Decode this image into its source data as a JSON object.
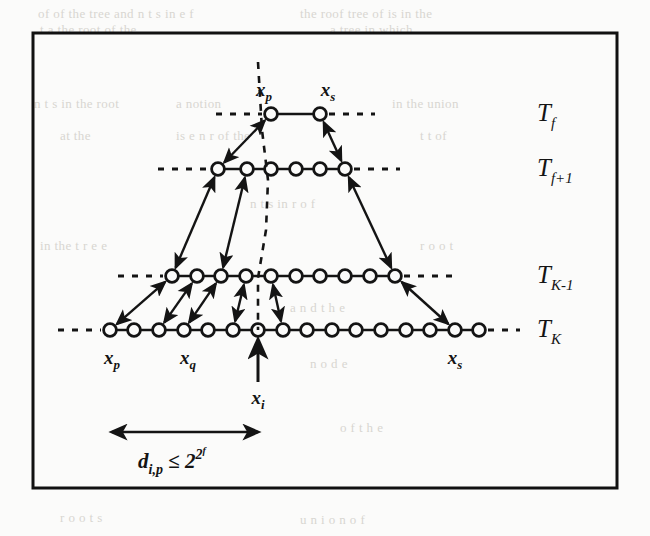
{
  "figure": {
    "kind": "hierarchical-tree-diagram",
    "border_color": "#111111",
    "ink_color": "#141414",
    "background": "#fbfbfa",
    "rows": [
      {
        "id": "row-tf",
        "label": "T",
        "label_sub": "f",
        "y": 114,
        "node_count": 2,
        "node_x": [
          271,
          320
        ],
        "leader_left": {
          "x1": 216,
          "x2": 262
        },
        "leader_right": {
          "x1": 329,
          "x2": 375
        }
      },
      {
        "id": "row-tf1",
        "label": "T",
        "label_sub": "f+1",
        "y": 169,
        "node_count": 6,
        "node_x": [
          218,
          247,
          271,
          296,
          320,
          345
        ],
        "leader_left": {
          "x1": 158,
          "x2": 209
        },
        "leader_right": {
          "x1": 354,
          "x2": 400
        }
      },
      {
        "id": "row-tk1",
        "label": "T",
        "label_sub": "K-1",
        "y": 276,
        "node_count": 10,
        "node_x": [
          172,
          197,
          221,
          246,
          271,
          296,
          320,
          345,
          370,
          395
        ],
        "leader_left": {
          "x1": 118,
          "x2": 163
        },
        "leader_right": {
          "x1": 404,
          "x2": 452
        }
      },
      {
        "id": "row-tk",
        "label": "T",
        "label_sub": "K",
        "y": 330,
        "node_count": 16,
        "node_x": [
          110,
          134,
          159,
          184,
          208,
          233,
          258,
          283,
          307,
          332,
          356,
          381,
          406,
          430,
          455,
          479
        ],
        "leader_left": {
          "x1": 58,
          "x2": 101
        },
        "leader_right": {
          "x1": 488,
          "x2": 520
        }
      }
    ],
    "row_label_x": 537,
    "connections": [
      {
        "from": [
          271,
          114
        ],
        "to": [
          218,
          169
        ]
      },
      {
        "from": [
          320,
          114
        ],
        "to": [
          345,
          169
        ]
      },
      {
        "from": [
          218,
          169
        ],
        "to": [
          172,
          276
        ]
      },
      {
        "from": [
          247,
          169
        ],
        "to": [
          221,
          276
        ]
      },
      {
        "from": [
          345,
          169
        ],
        "to": [
          395,
          276
        ]
      },
      {
        "from": [
          172,
          276
        ],
        "to": [
          110,
          330
        ]
      },
      {
        "from": [
          197,
          276
        ],
        "to": [
          159,
          330
        ]
      },
      {
        "from": [
          221,
          276
        ],
        "to": [
          184,
          330
        ]
      },
      {
        "from": [
          246,
          276
        ],
        "to": [
          233,
          330
        ]
      },
      {
        "from": [
          271,
          276
        ],
        "to": [
          283,
          330
        ]
      },
      {
        "from": [
          395,
          276
        ],
        "to": [
          455,
          330
        ]
      }
    ],
    "dashed_spine": {
      "points": "258,62 262,130 268,180 266,230 258,278 258,330"
    },
    "pointer_arrow": {
      "x": 258,
      "y_from": 382,
      "y_to": 340
    },
    "measure_arrow": {
      "x1": 112,
      "x2": 258,
      "y": 432
    },
    "node_labels": [
      {
        "name": "node-label-xp-top",
        "base": "x",
        "sub": "p",
        "x": 264,
        "y": 96,
        "anchor": "middle"
      },
      {
        "name": "node-label-xs-top",
        "base": "x",
        "sub": "s",
        "x": 328,
        "y": 96,
        "anchor": "middle"
      },
      {
        "name": "node-label-xp-bottom",
        "base": "x",
        "sub": "p",
        "x": 112,
        "y": 364,
        "anchor": "middle"
      },
      {
        "name": "node-label-xq-bottom",
        "base": "x",
        "sub": "q",
        "x": 188,
        "y": 364,
        "anchor": "middle"
      },
      {
        "name": "node-label-xs-bottom",
        "base": "x",
        "sub": "s",
        "x": 455,
        "y": 364,
        "anchor": "middle"
      },
      {
        "name": "node-label-xi",
        "base": "x",
        "sub": "i",
        "x": 258,
        "y": 404,
        "anchor": "middle"
      }
    ],
    "bound_formula": {
      "base": "d",
      "sub": "i,p",
      "relation": "≤",
      "power_base": "2",
      "exponent_base": "2",
      "exponent_sub": "f",
      "x": 138,
      "y": 468
    },
    "frame": {
      "x": 33,
      "y": 33,
      "width": 584,
      "height": 455
    }
  },
  "page_bleed": {
    "note": "faint show-through text from the scanned page behind the figure",
    "lines": [
      {
        "text": "of  of the tree  and    n  t  s  in    e  f",
        "x": 38,
        "y": 6
      },
      {
        "text": "the  roof   tree    of    is   in  the",
        "x": 300,
        "y": 6
      },
      {
        "text": "t  a   the  root  of  the",
        "x": 40,
        "y": 22
      },
      {
        "text": "a   tree  in  which",
        "x": 330,
        "y": 22
      },
      {
        "text": "n  t  s  in  the  root",
        "x": 34,
        "y": 96
      },
      {
        "text": "a   notion",
        "x": 176,
        "y": 96
      },
      {
        "text": "in  the  union",
        "x": 392,
        "y": 96
      },
      {
        "text": "at  the",
        "x": 60,
        "y": 128
      },
      {
        "text": "is   e  n   r  of  the",
        "x": 176,
        "y": 128
      },
      {
        "text": "t  t   of",
        "x": 420,
        "y": 128
      },
      {
        "text": "n  t  s   in    r  o  f",
        "x": 250,
        "y": 196
      },
      {
        "text": "in  the  t  r  e  e",
        "x": 40,
        "y": 238
      },
      {
        "text": "r  o  o  t",
        "x": 420,
        "y": 238
      },
      {
        "text": "a  n  d    t  h  e",
        "x": 290,
        "y": 300
      },
      {
        "text": "n   o   d   e",
        "x": 310,
        "y": 356
      },
      {
        "text": "o   f     t   h   e",
        "x": 340,
        "y": 420
      },
      {
        "text": "r  o  o  t    s",
        "x": 60,
        "y": 510
      },
      {
        "text": "u   n   i   o   n     o   f",
        "x": 300,
        "y": 512
      }
    ]
  }
}
